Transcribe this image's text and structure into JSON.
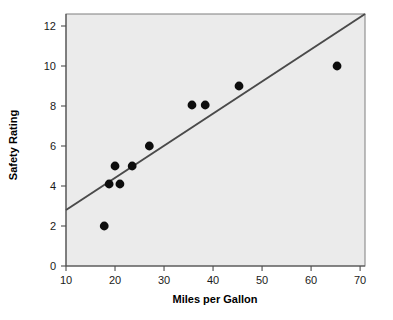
{
  "chart_data": {
    "type": "scatter",
    "title": "",
    "xlabel": "Miles per Gallon",
    "ylabel": "Safety Rating",
    "xlim": [
      10,
      71
    ],
    "ylim": [
      0,
      12.6
    ],
    "grid": false,
    "legend": false,
    "background_color": "#ebebeb",
    "point_color": "#0d0d0d",
    "line_color": "#4a4a4a",
    "xticks": [
      "10",
      "20",
      "30",
      "40",
      "50",
      "60",
      "70"
    ],
    "xtick_values": [
      10,
      20,
      30,
      40,
      50,
      60,
      70
    ],
    "yticks": [
      "0",
      "2",
      "4",
      "6",
      "8",
      "10",
      "12"
    ],
    "ytick_values": [
      0,
      2,
      4,
      6,
      8,
      10,
      12
    ],
    "points": [
      {
        "x": 17.8,
        "y": 2.0
      },
      {
        "x": 18.8,
        "y": 4.1
      },
      {
        "x": 20.0,
        "y": 5.0
      },
      {
        "x": 21.0,
        "y": 4.1
      },
      {
        "x": 23.5,
        "y": 5.0
      },
      {
        "x": 27.0,
        "y": 6.0
      },
      {
        "x": 35.7,
        "y": 8.05
      },
      {
        "x": 38.4,
        "y": 8.05
      },
      {
        "x": 45.3,
        "y": 9.0
      },
      {
        "x": 65.3,
        "y": 10.0
      }
    ],
    "trend_line": {
      "label": "linear fit",
      "x1": 10.0,
      "y1": 2.8,
      "x2": 71.0,
      "y2": 12.6
    }
  }
}
